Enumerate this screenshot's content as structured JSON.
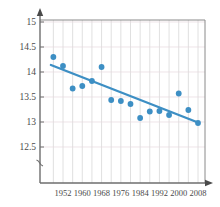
{
  "chart_data": {
    "type": "scatter",
    "title": "",
    "subtitle": "",
    "xlabel": "",
    "ylabel": "",
    "xlim": [
      1946,
      2010
    ],
    "ylim": [
      12.25,
      15.0
    ],
    "yticks": [
      "15",
      "14.5",
      "14",
      "13.5",
      "13",
      "12.5"
    ],
    "ytick_values": [
      15,
      14.5,
      14,
      13.5,
      13,
      12.5
    ],
    "xticks": [
      "1952",
      "1960",
      "1968",
      "1976",
      "1984",
      "1992",
      "2000",
      "2008"
    ],
    "xtick_values": [
      1952,
      1960,
      1968,
      1976,
      1984,
      1992,
      2000,
      2008
    ],
    "grid": true,
    "axis_break": "y-axis break below 12.5",
    "legend": null,
    "legend_position": "none",
    "marker_color": "#3d8fc4",
    "line_color": "#3d8fc4",
    "grid_color": "#d8d8d8",
    "axis_color": "#6e6e6e",
    "x": [
      1948,
      1952,
      1956,
      1960,
      1964,
      1968,
      1972,
      1976,
      1980,
      1984,
      1988,
      1992,
      1996,
      2000,
      2004,
      2008
    ],
    "y": [
      14.3,
      14.12,
      13.67,
      13.72,
      13.82,
      14.1,
      13.44,
      13.42,
      13.36,
      13.08,
      13.21,
      13.22,
      13.14,
      13.57,
      13.24,
      12.98
    ],
    "series": [
      {
        "name": "data points",
        "type": "scatter",
        "x": [
          1948,
          1952,
          1956,
          1960,
          1964,
          1968,
          1972,
          1976,
          1980,
          1984,
          1988,
          1992,
          1996,
          2000,
          2004,
          2008
        ],
        "values": [
          14.3,
          14.12,
          13.67,
          13.72,
          13.82,
          14.1,
          13.44,
          13.42,
          13.36,
          13.08,
          13.21,
          13.22,
          13.14,
          13.57,
          13.24,
          12.98
        ]
      },
      {
        "name": "trend line",
        "type": "line",
        "x": [
          1947,
          2008
        ],
        "values": [
          14.14,
          12.99
        ]
      }
    ],
    "trendline": {
      "x_start": 1947,
      "y_start": 14.14,
      "x_end": 2008,
      "y_end": 12.99,
      "slope_per_year": -0.01885
    }
  }
}
